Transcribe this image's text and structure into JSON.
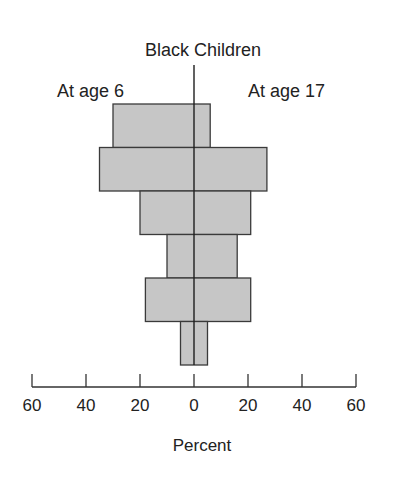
{
  "chart_data": {
    "type": "bar",
    "subtype": "population-pyramid (back-to-back horizontal bars)",
    "title": "Black Children",
    "xlabel": "Percent",
    "ylabel": "",
    "categories": [
      "Row 1 (top)",
      "Row 2",
      "Row 3",
      "Row 4",
      "Row 5",
      "Row 6 (bottom)"
    ],
    "series": [
      {
        "name": "At age 6",
        "side": "left",
        "values": [
          30,
          35,
          20,
          10,
          18,
          5
        ]
      },
      {
        "name": "At age 17",
        "side": "right",
        "values": [
          6,
          27,
          21,
          16,
          21,
          5
        ]
      }
    ],
    "x_ticks": [
      60,
      40,
      20,
      0,
      20,
      40,
      60
    ],
    "xlim": [
      -60,
      60
    ],
    "grid": false,
    "legend_position": "labels above each side",
    "colors": {
      "bar_fill": "#c6c6c6",
      "bar_stroke": "#3a3a3a",
      "center_line": "#1e1e1e",
      "axis": "#333333"
    }
  },
  "labels": {
    "title": "Black Children",
    "left_side": "At age 6",
    "right_side": "At age 17",
    "xlabel": "Percent",
    "ticks": [
      "60",
      "40",
      "20",
      "0",
      "20",
      "40",
      "60"
    ]
  }
}
